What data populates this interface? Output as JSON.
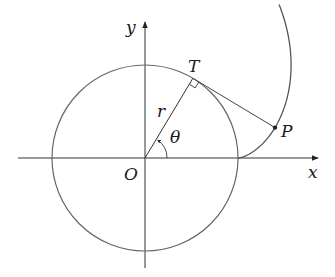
{
  "diagram": {
    "origin": {
      "x": 145,
      "y": 158
    },
    "radius": 93,
    "theta_rad": 1.03,
    "stroke_color": "#555555",
    "axis_color": "#333333",
    "labels": {
      "x_axis": "x",
      "y_axis": "y",
      "origin": "O",
      "tangent_point": "T",
      "curve_point": "P",
      "radius": "r",
      "angle": "θ"
    },
    "points": {
      "O": {
        "x": 145,
        "y": 158
      },
      "T": {
        "x": 190,
        "y": 78
      },
      "P": {
        "x": 275,
        "y": 128
      }
    },
    "curve": {
      "type": "involute",
      "t_start": 0,
      "t_end": 1.95
    }
  }
}
